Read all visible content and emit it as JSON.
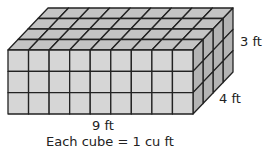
{
  "diagram": {
    "type": "rectangular-prism-of-unit-cubes",
    "length_cubes": 9,
    "width_cubes": 4,
    "height_cubes": 3,
    "labels": {
      "length": "9 ft",
      "width": "4 ft",
      "height": "3 ft",
      "caption": "Each cube = 1 cu ft"
    },
    "colors": {
      "front": "#d6d6d6",
      "top": "#c4c4c4",
      "side": "#b4b4b4",
      "line": "#222222"
    }
  }
}
